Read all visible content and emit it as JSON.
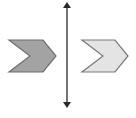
{
  "diagram": {
    "type": "reflection",
    "canvas": {
      "width": 136,
      "height": 118,
      "background": "#ffffff"
    },
    "line_of_reflection": {
      "orientation": "vertical",
      "x": 67,
      "y_top": 2,
      "y_bottom": 108,
      "color": "#2a2a2a",
      "arrows": "both-ends"
    },
    "shapes": [
      {
        "id": "preimage",
        "kind": "chevron",
        "points": [
          [
            9,
            40
          ],
          [
            43,
            40
          ],
          [
            56,
            56
          ],
          [
            43,
            72
          ],
          [
            9,
            72
          ],
          [
            30,
            56
          ]
        ],
        "fill": "#a3a3a3",
        "stroke": "#6f6f6f"
      },
      {
        "id": "image",
        "kind": "chevron",
        "points": [
          [
            82,
            40
          ],
          [
            115,
            40
          ],
          [
            128,
            56
          ],
          [
            115,
            72
          ],
          [
            82,
            72
          ],
          [
            103,
            56
          ]
        ],
        "fill": "#e4e4e4",
        "stroke": "#7a7a7a"
      }
    ]
  }
}
